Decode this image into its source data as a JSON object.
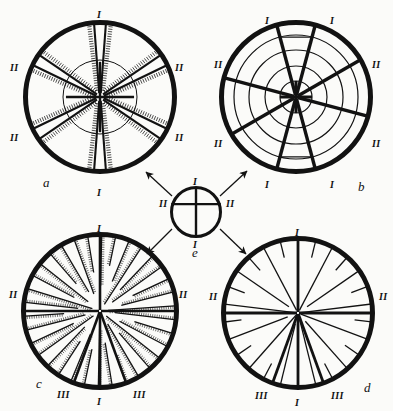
{
  "figure": {
    "background_color": "#fbfbf9",
    "ink_color": "#121212",
    "panels": [
      {
        "id": "a",
        "label": "a",
        "type": "six-ray sectored disc with inner circle and feathered rays",
        "center": [
          100,
          97
        ],
        "radius": 77,
        "inner_radius": 37,
        "rim_width": 5,
        "ray_count": 6,
        "ray_angles_deg": [
          90,
          30,
          330,
          270,
          210,
          150
        ],
        "markers": [
          {
            "text": "I",
            "angle_deg": 90,
            "x": 97,
            "y": 10
          },
          {
            "text": "I",
            "angle_deg": 270,
            "x": 97,
            "y": 188
          },
          {
            "text": "II",
            "angle_deg": 150,
            "x": 10,
            "y": 63
          },
          {
            "text": "II",
            "angle_deg": 30,
            "x": 175,
            "y": 63
          },
          {
            "text": "II",
            "angle_deg": 210,
            "x": 10,
            "y": 133
          },
          {
            "text": "II",
            "angle_deg": 330,
            "x": 175,
            "y": 133
          }
        ]
      },
      {
        "id": "b",
        "label": "b",
        "type": "concentric-ring disc with eight radial bars",
        "center": [
          296,
          97
        ],
        "radius": 77,
        "rim_width": 5,
        "ring_radii": [
          16,
          31,
          47,
          62
        ],
        "ray_count": 8,
        "ray_angles_deg": [
          105,
          75,
          30,
          345,
          285,
          255,
          210,
          165
        ],
        "markers": [
          {
            "text": "I",
            "angle_deg": 105,
            "x": 265,
            "y": 16
          },
          {
            "text": "I",
            "angle_deg": 75,
            "x": 330,
            "y": 16
          },
          {
            "text": "II",
            "angle_deg": 150,
            "x": 214,
            "y": 60
          },
          {
            "text": "II",
            "angle_deg": 30,
            "x": 372,
            "y": 60
          },
          {
            "text": "II",
            "angle_deg": 210,
            "x": 214,
            "y": 139
          },
          {
            "text": "II",
            "angle_deg": 330,
            "x": 372,
            "y": 139
          },
          {
            "text": "I",
            "angle_deg": 255,
            "x": 265,
            "y": 180
          },
          {
            "text": "I",
            "angle_deg": 285,
            "x": 330,
            "y": 180
          }
        ]
      },
      {
        "id": "c",
        "label": "c",
        "type": "dense many-rayed disc with dotted hatching",
        "center": [
          100,
          311
        ],
        "radius": 79,
        "rim_width": 5,
        "major_ray_angles_deg": [
          90,
          180,
          0,
          250,
          290,
          270
        ],
        "minor_ray_count": 34,
        "markers": [
          {
            "text": "I",
            "angle_deg": 90,
            "x": 97,
            "y": 224
          },
          {
            "text": "I",
            "angle_deg": 270,
            "x": 97,
            "y": 397
          },
          {
            "text": "II",
            "angle_deg": 180,
            "x": 9,
            "y": 290
          },
          {
            "text": "II",
            "angle_deg": 0,
            "x": 179,
            "y": 290
          },
          {
            "text": "III",
            "angle_deg": 250,
            "x": 57,
            "y": 390
          },
          {
            "text": "III",
            "angle_deg": 290,
            "x": 133,
            "y": 390
          }
        ]
      },
      {
        "id": "d",
        "label": "d",
        "type": "open many-rayed disc with plain wedges",
        "center": [
          298,
          313
        ],
        "radius": 77,
        "rim_width": 5,
        "major_ray_angles_deg": [
          90,
          180,
          0,
          250,
          290,
          270
        ],
        "minor_ray_count": 26,
        "markers": [
          {
            "text": "I",
            "angle_deg": 90,
            "x": 295,
            "y": 228
          },
          {
            "text": "I",
            "angle_deg": 270,
            "x": 295,
            "y": 398
          },
          {
            "text": "II",
            "angle_deg": 180,
            "x": 209,
            "y": 292
          },
          {
            "text": "II",
            "angle_deg": 0,
            "x": 379,
            "y": 292
          },
          {
            "text": "III",
            "angle_deg": 250,
            "x": 255,
            "y": 391
          },
          {
            "text": "III",
            "angle_deg": 290,
            "x": 331,
            "y": 391
          }
        ]
      },
      {
        "id": "e",
        "label": "e",
        "type": "small key circle with vertical diameter and offset horizontal chord",
        "center": [
          196,
          212
        ],
        "radius": 26,
        "rim_width": 3,
        "markers": [
          {
            "text": "I",
            "angle_deg": 90,
            "x": 193,
            "y": 177
          },
          {
            "text": "I",
            "angle_deg": 270,
            "x": 193,
            "y": 240
          },
          {
            "text": "II",
            "angle_deg": 180,
            "x": 159,
            "y": 199
          },
          {
            "text": "II",
            "angle_deg": 0,
            "x": 226,
            "y": 199
          }
        ]
      }
    ],
    "arrows": [
      {
        "from_panel": "e",
        "to_panel": "a",
        "x1": 172,
        "y1": 196,
        "x2": 146,
        "y2": 172
      },
      {
        "from_panel": "e",
        "to_panel": "b",
        "x1": 220,
        "y1": 196,
        "x2": 247,
        "y2": 171
      },
      {
        "from_panel": "e",
        "to_panel": "c",
        "x1": 172,
        "y1": 229,
        "x2": 147,
        "y2": 254
      },
      {
        "from_panel": "e",
        "to_panel": "d",
        "x1": 220,
        "y1": 229,
        "x2": 246,
        "y2": 254
      }
    ]
  }
}
